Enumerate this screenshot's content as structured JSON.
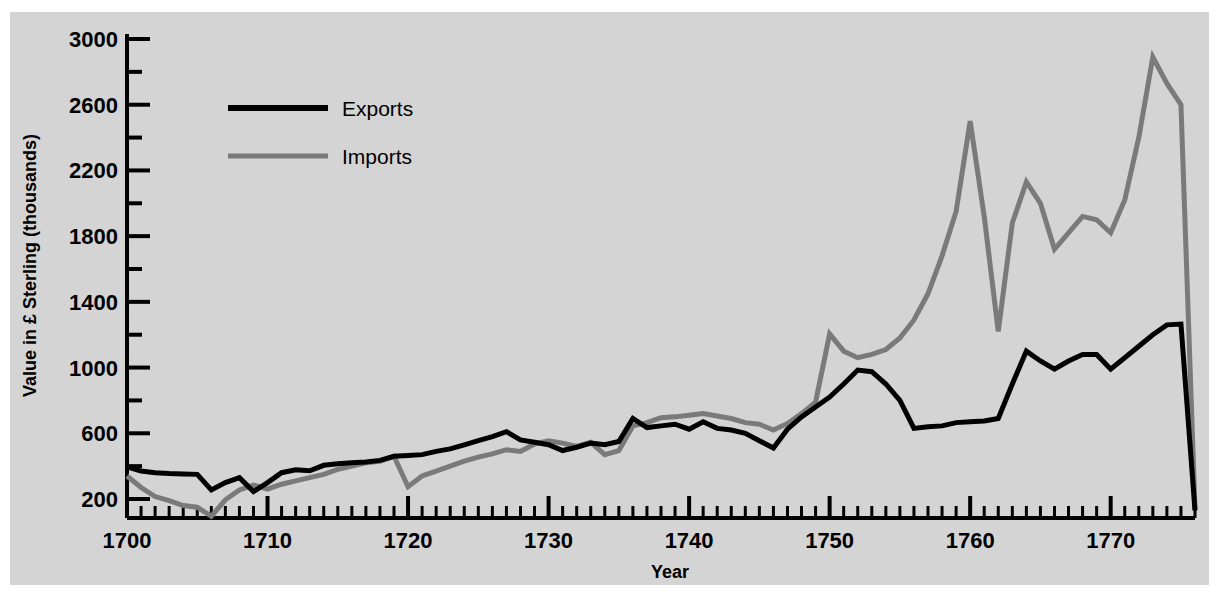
{
  "chart_data": {
    "type": "line",
    "title": "",
    "xlabel": "Year",
    "ylabel": "Value in £ Sterling (thousands)",
    "xlim": [
      1700,
      1776
    ],
    "ylim": [
      70,
      3000
    ],
    "grid": false,
    "legend_position": "top-left-inside",
    "x_ticks_major": [
      1700,
      1710,
      1720,
      1730,
      1740,
      1750,
      1760,
      1770
    ],
    "x_tick_labels": [
      "1700",
      "1710",
      "1720",
      "1730",
      "1740",
      "1750",
      "1760",
      "1770"
    ],
    "x_minor_step": 1,
    "y_ticks_major": [
      200,
      600,
      1000,
      1400,
      1800,
      2200,
      2600,
      3000
    ],
    "y_tick_labels": [
      "200",
      "600",
      "1000",
      "1400",
      "1800",
      "2200",
      "2600",
      "3000"
    ],
    "y_minor_ticks": [
      400,
      800,
      1200,
      1600,
      2000,
      2400,
      2800
    ],
    "x": [
      1700,
      1701,
      1702,
      1703,
      1704,
      1705,
      1706,
      1707,
      1708,
      1709,
      1710,
      1711,
      1712,
      1713,
      1714,
      1715,
      1716,
      1717,
      1718,
      1719,
      1720,
      1721,
      1722,
      1723,
      1724,
      1725,
      1726,
      1727,
      1728,
      1729,
      1730,
      1731,
      1732,
      1733,
      1734,
      1735,
      1736,
      1737,
      1738,
      1739,
      1740,
      1741,
      1742,
      1743,
      1744,
      1745,
      1746,
      1747,
      1748,
      1749,
      1750,
      1751,
      1752,
      1753,
      1754,
      1755,
      1756,
      1757,
      1758,
      1759,
      1760,
      1761,
      1762,
      1763,
      1764,
      1765,
      1766,
      1767,
      1768,
      1769,
      1770,
      1771,
      1772,
      1773,
      1774,
      1775,
      1776
    ],
    "series": [
      {
        "name": "Exports",
        "color": "#000000",
        "line_width": 5,
        "values": [
          395,
          370,
          360,
          355,
          352,
          350,
          255,
          300,
          330,
          245,
          300,
          360,
          378,
          372,
          405,
          415,
          420,
          425,
          435,
          460,
          465,
          470,
          490,
          505,
          530,
          555,
          580,
          610,
          560,
          545,
          530,
          495,
          515,
          540,
          530,
          550,
          690,
          635,
          645,
          655,
          625,
          670,
          630,
          620,
          600,
          555,
          510,
          625,
          700,
          760,
          820,
          900,
          985,
          975,
          900,
          800,
          630,
          640,
          645,
          665,
          670,
          675,
          690,
          900,
          1100,
          1040,
          990,
          1040,
          1080,
          1080,
          990,
          1060,
          1130,
          1200,
          1260,
          1265,
          130
        ]
      },
      {
        "name": "Imports",
        "color": "#7a7a7a",
        "line_width": 5,
        "values": [
          340,
          270,
          215,
          190,
          160,
          150,
          95,
          195,
          255,
          285,
          260,
          290,
          310,
          330,
          350,
          380,
          400,
          420,
          430,
          460,
          275,
          340,
          370,
          400,
          430,
          455,
          475,
          500,
          490,
          535,
          555,
          540,
          520,
          545,
          470,
          495,
          645,
          665,
          695,
          700,
          710,
          720,
          705,
          690,
          665,
          655,
          620,
          660,
          720,
          790,
          1205,
          1100,
          1060,
          1080,
          1110,
          1180,
          1290,
          1450,
          1680,
          1950,
          2500,
          1920,
          1220,
          1880,
          2130,
          2000,
          1720,
          1820,
          1920,
          1900,
          1820,
          2020,
          2400,
          2890,
          2730,
          2600,
          140
        ]
      }
    ],
    "legend": [
      {
        "label": "Exports",
        "color": "#000000",
        "line_width": 6
      },
      {
        "label": "Imports",
        "color": "#7a7a7a",
        "line_width": 5
      }
    ]
  },
  "axes": {
    "y_label_text": "Value in £ Sterling (thousands)",
    "x_label_text": "Year"
  }
}
